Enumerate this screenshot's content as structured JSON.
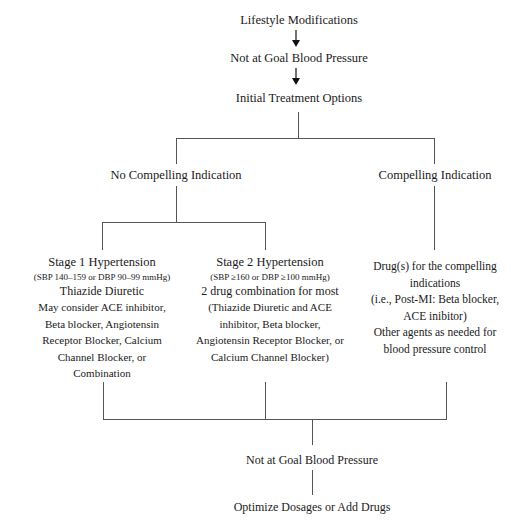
{
  "flowchart": {
    "top": {
      "lifestyle": "Lifestyle Modifications",
      "not_at_goal_1": "Not at Goal Blood Pressure",
      "initial_treatment": "Initial Treatment Options"
    },
    "branches": {
      "no_compelling": "No Compelling Indication",
      "compelling": "Compelling Indication"
    },
    "stage1": {
      "title": "Stage 1 Hypertension",
      "criteria": "(SBP 140–159 or DBP 90–99 mmHg)",
      "lines": [
        "Thiazide Diuretic",
        "May consider ACE inhibitor,",
        "Beta blocker, Angiotensin",
        "Receptor Blocker, Calcium",
        "Channel Blocker, or",
        "Combination"
      ]
    },
    "stage2": {
      "title": "Stage 2 Hypertension",
      "criteria": "(SBP ≥160 or DBP ≥100 mmHg)",
      "lines": [
        "2 drug combination for most",
        "(Thiazide Diuretic and ACE",
        "inhibitor,  Beta blocker,",
        "Angiotensin Receptor Blocker, or",
        "Calcium Channel Blocker)"
      ]
    },
    "compelling_drugs": {
      "lines": [
        "Drug(s) for the compelling",
        "indications",
        "(i.e., Post-MI: Beta blocker,",
        "ACE inibitor)",
        "Other agents as needed for",
        "blood pressure control"
      ]
    },
    "bottom": {
      "not_at_goal_2": "Not at Goal Blood Pressure",
      "optimize": "Optimize Dosages or Add Drugs"
    },
    "icons": [
      "arrow-down-icon",
      "arrow-down-icon"
    ],
    "colors": {
      "text": "#1a1a1a",
      "line": "#555555",
      "background": "#ffffff"
    }
  }
}
